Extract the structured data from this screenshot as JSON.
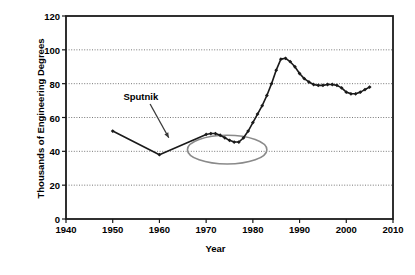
{
  "chart_data": {
    "type": "line",
    "title": "",
    "xlabel": "Year",
    "ylabel": "Thousands of Engineering Degrees",
    "xlim": [
      1940,
      2010
    ],
    "ylim": [
      0,
      120
    ],
    "xticks": [
      1940,
      1950,
      1960,
      1970,
      1980,
      1990,
      2000,
      2010
    ],
    "yticks": [
      0,
      20,
      40,
      60,
      80,
      100,
      120
    ],
    "grid": "horizontal-dotted",
    "legend": "none",
    "series": [
      {
        "name": "Engineering Degrees Awarded",
        "marker": "filled-diamond",
        "color": "#1a1a1a",
        "x": [
          1950,
          1960,
          1970,
          1971,
          1972,
          1973,
          1974,
          1975,
          1976,
          1977,
          1978,
          1979,
          1980,
          1981,
          1982,
          1983,
          1984,
          1985,
          1986,
          1987,
          1988,
          1989,
          1990,
          1991,
          1992,
          1993,
          1994,
          1995,
          1996,
          1997,
          1998,
          1999,
          2000,
          2001,
          2002,
          2003,
          2004,
          2005
        ],
        "y": [
          52,
          38,
          50,
          50.5,
          50.5,
          49.5,
          48,
          46.5,
          45.5,
          45.5,
          48,
          52,
          57,
          62,
          67,
          73,
          80,
          88,
          94.5,
          95,
          93,
          90,
          86,
          83,
          81,
          79.5,
          79,
          79,
          79.5,
          79.5,
          79,
          77.5,
          75,
          74,
          74,
          75,
          76.5,
          78
        ]
      }
    ],
    "annotations": [
      {
        "name": "sputnik-annotation",
        "text": "Sputnik",
        "text_x": 1957,
        "text_y": 72,
        "arrow_from_x": 1958,
        "arrow_from_y": 68,
        "arrow_to_x": 1962,
        "arrow_to_y": 48,
        "highlight": {
          "shape": "ellipse",
          "color": "#8a8a8a",
          "center_x": 1974.5,
          "center_y": 41,
          "rx_years": 8.5,
          "ry_value": 8.5
        }
      }
    ]
  }
}
